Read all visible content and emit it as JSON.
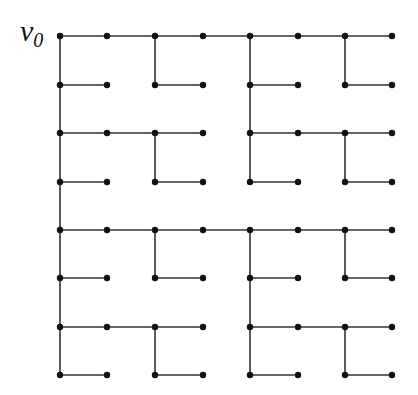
{
  "diagram": {
    "type": "spanning-tree-grid",
    "root_label": "v",
    "root_subscript": "0",
    "grid": {
      "cols": 8,
      "rows": 8,
      "x": [
        60,
        107,
        155,
        203,
        250,
        298,
        345,
        392
      ],
      "y": [
        36,
        85,
        133,
        182,
        230,
        278,
        327,
        375
      ]
    },
    "colors": {
      "edge": "#333333",
      "node": "#111111",
      "background": "#ffffff"
    },
    "quadrant_origins": [
      [
        0,
        0
      ],
      [
        4,
        0
      ],
      [
        0,
        4
      ],
      [
        4,
        4
      ]
    ],
    "quadrant_edges": [
      [
        [
          0,
          0
        ],
        [
          3,
          0
        ]
      ],
      [
        [
          0,
          1
        ],
        [
          1,
          1
        ]
      ],
      [
        [
          2,
          1
        ],
        [
          3,
          1
        ]
      ],
      [
        [
          0,
          2
        ],
        [
          3,
          2
        ]
      ],
      [
        [
          0,
          3
        ],
        [
          1,
          3
        ]
      ],
      [
        [
          2,
          3
        ],
        [
          3,
          3
        ]
      ],
      [
        [
          0,
          0
        ],
        [
          0,
          3
        ]
      ],
      [
        [
          2,
          0
        ],
        [
          2,
          1
        ]
      ],
      [
        [
          2,
          2
        ],
        [
          2,
          3
        ]
      ]
    ],
    "connector_edges": [
      [
        [
          0,
          3
        ],
        [
          0,
          4
        ]
      ],
      [
        [
          3,
          0
        ],
        [
          4,
          0
        ]
      ],
      [
        [
          3,
          4
        ],
        [
          4,
          4
        ]
      ]
    ]
  }
}
